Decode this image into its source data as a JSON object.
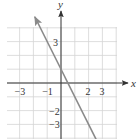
{
  "chart_data": {
    "type": "line",
    "title": "",
    "xlabel": "x",
    "ylabel": "y",
    "xlim": [
      -4,
      4
    ],
    "ylim": [
      -4,
      4
    ],
    "grid": true,
    "x_tick_labels": [
      {
        "value": -3,
        "label": "−3"
      },
      {
        "value": -1,
        "label": "−1"
      },
      {
        "value": 2,
        "label": "2"
      },
      {
        "value": 3,
        "label": "3"
      }
    ],
    "y_tick_labels": [
      {
        "value": 3,
        "label": "3"
      },
      {
        "value": -2,
        "label": "−2"
      },
      {
        "value": -3,
        "label": "−3"
      }
    ],
    "series": [
      {
        "name": "line",
        "equation": "y = -2x + 1",
        "slope": -2,
        "intercept": 1,
        "x": [
          -1.9,
          3.3
        ],
        "y": [
          4.8,
          -5.6
        ],
        "arrows": "both",
        "color": "#8a8a8a"
      }
    ]
  },
  "colors": {
    "grid": "#d4d4d4",
    "axis": "#333333",
    "line": "#8a8a8a"
  },
  "labels": {
    "x_axis": "x",
    "y_axis": "y"
  }
}
